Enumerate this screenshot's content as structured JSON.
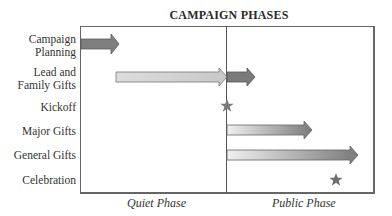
{
  "title": "CAMPAIGN PHASES",
  "rows": [
    {
      "label_line1": "Campaign",
      "label_line2": "Planning"
    },
    {
      "label_line1": "Lead and",
      "label_line2": "Family Gifts"
    },
    {
      "label": "Kickoff"
    },
    {
      "label": "Major Gifts"
    },
    {
      "label": "General Gifts"
    },
    {
      "label": "Celebration"
    }
  ],
  "phases": {
    "quiet": "Quiet Phase",
    "public": "Public Phase"
  },
  "colors": {
    "arrow_dark": "#7a7a7a",
    "arrow_light": "#d8d8d8",
    "star": "#7a7a7a",
    "frame": "#666666"
  }
}
